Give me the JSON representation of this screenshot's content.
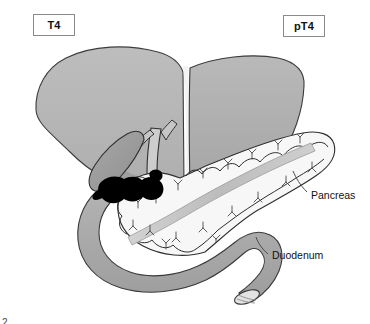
{
  "figure": {
    "width": 370,
    "height": 324,
    "background_color": "#ffffff",
    "figure_number_partial": "2"
  },
  "stage_labels": {
    "clinical": {
      "text": "T4",
      "name": "clinical-stage-label"
    },
    "pathologic": {
      "text": "pT4",
      "name": "pathologic-stage-label"
    }
  },
  "organ_labels": [
    {
      "text": "Pancreas",
      "name": "pancreas-label"
    },
    {
      "text": "Duodenum",
      "name": "duodenum-label"
    }
  ],
  "colors": {
    "liver_fill": "#b6b6b6",
    "liver_fill_dark": "#a6a6a6",
    "liver_edge": "#3a3a3a",
    "falciform_highlight": "#f2f2f2",
    "gallbladder_fill": "#9c9c9c",
    "bile_duct_fill": "#c8c8c8",
    "pancreas_fill": "#f7f7f7",
    "pancreas_edge": "#2e2e2e",
    "pancreatic_duct_fill": "#bdbdbd",
    "duodenum_fill": "#a8a8a8",
    "duodenum_edge": "#3a3a3a",
    "tumor_fill": "#000000",
    "label_box_border": "#8a8a8a",
    "text_color": "#111111"
  },
  "structures": [
    {
      "name": "liver",
      "description": "large bilobed gray organ across upper portion"
    },
    {
      "name": "falciform-ligament",
      "description": "pale vertical cleft dividing liver lobes"
    },
    {
      "name": "gallbladder",
      "description": "pear-shaped organ beneath liver, left of bile duct"
    },
    {
      "name": "common-bile-duct",
      "description": "vertical duct descending from liver hilum into pancreatic head"
    },
    {
      "name": "tumor-mass",
      "description": "solid black irregular mass at pancreatic head / bile duct junction"
    },
    {
      "name": "pancreas",
      "description": "lobulated pale organ extending to upper right, head to tail"
    },
    {
      "name": "pancreatic-duct",
      "description": "gray duct running the length of the pancreas"
    },
    {
      "name": "duodenum",
      "description": "gray C-loop tube curving around pancreatic head, cut open at distal end"
    }
  ]
}
